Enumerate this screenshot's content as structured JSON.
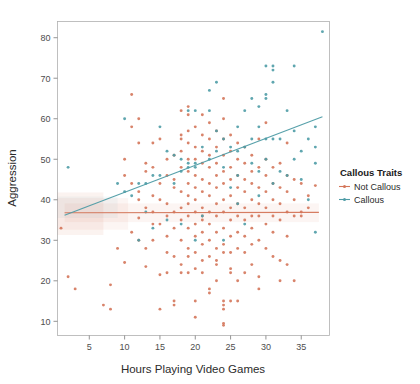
{
  "chart_data": {
    "type": "scatter",
    "title": "",
    "xlabel": "Hours Playing Video Games",
    "ylabel": "Aggression",
    "xlim": [
      0.5,
      39
    ],
    "ylim": [
      6.5,
      84
    ],
    "xticks": [
      5,
      10,
      15,
      20,
      25,
      30,
      35
    ],
    "yticks": [
      10,
      20,
      30,
      40,
      50,
      60,
      70,
      80
    ],
    "grid": false,
    "legend": {
      "title": "Callous Traits",
      "position": "right",
      "entries": [
        {
          "name": "Not Callous",
          "color": "#D4765A"
        },
        {
          "name": "Callous",
          "color": "#4E9CA6"
        }
      ]
    },
    "series": [
      {
        "name": "Not Callous",
        "color": "#D4765A",
        "fit": {
          "type": "linear",
          "x": [
            1.5,
            37.5
          ],
          "y": [
            36.8,
            36.9
          ],
          "band": true
        },
        "points": [
          [
            1,
            33
          ],
          [
            2,
            21
          ],
          [
            3,
            18
          ],
          [
            7,
            14
          ],
          [
            8,
            13
          ],
          [
            8,
            19
          ],
          [
            9,
            28
          ],
          [
            10,
            46
          ],
          [
            10,
            24.5
          ],
          [
            11,
            66
          ],
          [
            11,
            58
          ],
          [
            11,
            32
          ],
          [
            11,
            44
          ],
          [
            12,
            54
          ],
          [
            12,
            60
          ],
          [
            12,
            42
          ],
          [
            12,
            35.5
          ],
          [
            12,
            30
          ],
          [
            13,
            49
          ],
          [
            13,
            47
          ],
          [
            13,
            38
          ],
          [
            13,
            28
          ],
          [
            13,
            23.5
          ],
          [
            14,
            54
          ],
          [
            14,
            48
          ],
          [
            14,
            41
          ],
          [
            14,
            37
          ],
          [
            14,
            34
          ],
          [
            15,
            55
          ],
          [
            15,
            44
          ],
          [
            15,
            40
          ],
          [
            15,
            34
          ],
          [
            15,
            21.5
          ],
          [
            15,
            13
          ],
          [
            16,
            50
          ],
          [
            16,
            46
          ],
          [
            16,
            39
          ],
          [
            16,
            36
          ],
          [
            16,
            31
          ],
          [
            16,
            22
          ],
          [
            17,
            51
          ],
          [
            17,
            45
          ],
          [
            17,
            43
          ],
          [
            17,
            37
          ],
          [
            17,
            33
          ],
          [
            17,
            26
          ],
          [
            17,
            15
          ],
          [
            17,
            14
          ],
          [
            18,
            62
          ],
          [
            18,
            56
          ],
          [
            18,
            55
          ],
          [
            18,
            52
          ],
          [
            18,
            48
          ],
          [
            18,
            42
          ],
          [
            18,
            38
          ],
          [
            18,
            35
          ],
          [
            18,
            30
          ],
          [
            18,
            24
          ],
          [
            18,
            22
          ],
          [
            19,
            61
          ],
          [
            19,
            57
          ],
          [
            19,
            54
          ],
          [
            19,
            50
          ],
          [
            19,
            47
          ],
          [
            19,
            44
          ],
          [
            19,
            41
          ],
          [
            19,
            39
          ],
          [
            19,
            36
          ],
          [
            19,
            33
          ],
          [
            19,
            28
          ],
          [
            19,
            26
          ],
          [
            19,
            22
          ],
          [
            20,
            58
          ],
          [
            20,
            53
          ],
          [
            20,
            50
          ],
          [
            20,
            46
          ],
          [
            20,
            43
          ],
          [
            20,
            40
          ],
          [
            20,
            37
          ],
          [
            20,
            34
          ],
          [
            20,
            31
          ],
          [
            20,
            27
          ],
          [
            20,
            23
          ],
          [
            20,
            15
          ],
          [
            20,
            11
          ],
          [
            21,
            61
          ],
          [
            21,
            56
          ],
          [
            21,
            52
          ],
          [
            21,
            49
          ],
          [
            21,
            45
          ],
          [
            21,
            42
          ],
          [
            21,
            38
          ],
          [
            21,
            35
          ],
          [
            21,
            32
          ],
          [
            21,
            29
          ],
          [
            21,
            25
          ],
          [
            21,
            22
          ],
          [
            22,
            59
          ],
          [
            22,
            55
          ],
          [
            22,
            51
          ],
          [
            22,
            48
          ],
          [
            22,
            44
          ],
          [
            22,
            41
          ],
          [
            22,
            37
          ],
          [
            22,
            34
          ],
          [
            22,
            30
          ],
          [
            22,
            26
          ],
          [
            22,
            18
          ],
          [
            22,
            17
          ],
          [
            23,
            57
          ],
          [
            23,
            53
          ],
          [
            23,
            49
          ],
          [
            23,
            46
          ],
          [
            23,
            43
          ],
          [
            23,
            39
          ],
          [
            23,
            36
          ],
          [
            23,
            32
          ],
          [
            23,
            28
          ],
          [
            23,
            24
          ],
          [
            23,
            20
          ],
          [
            24,
            65
          ],
          [
            24,
            60
          ],
          [
            24,
            55
          ],
          [
            24,
            51
          ],
          [
            24,
            47
          ],
          [
            24,
            44
          ],
          [
            24,
            40
          ],
          [
            24,
            37
          ],
          [
            24,
            33
          ],
          [
            24,
            29
          ],
          [
            24,
            27
          ],
          [
            24,
            15
          ],
          [
            24,
            14
          ],
          [
            24,
            13
          ],
          [
            24,
            9.5
          ],
          [
            24,
            9
          ],
          [
            25,
            56
          ],
          [
            25,
            52
          ],
          [
            25,
            48
          ],
          [
            25,
            45
          ],
          [
            25,
            41
          ],
          [
            25,
            38
          ],
          [
            25,
            35
          ],
          [
            25,
            31
          ],
          [
            25,
            27
          ],
          [
            25,
            23
          ],
          [
            25,
            15
          ],
          [
            26,
            54
          ],
          [
            26,
            50
          ],
          [
            26,
            46
          ],
          [
            26,
            43
          ],
          [
            26,
            39
          ],
          [
            26,
            36
          ],
          [
            26,
            32
          ],
          [
            26,
            28
          ],
          [
            26,
            20
          ],
          [
            26,
            15
          ],
          [
            27,
            53
          ],
          [
            27,
            49
          ],
          [
            27,
            45
          ],
          [
            27,
            42
          ],
          [
            27,
            38
          ],
          [
            27,
            35
          ],
          [
            27,
            31
          ],
          [
            27,
            27
          ],
          [
            27,
            22
          ],
          [
            28,
            51
          ],
          [
            28,
            47
          ],
          [
            28,
            44
          ],
          [
            28,
            40
          ],
          [
            28,
            36
          ],
          [
            28,
            33
          ],
          [
            28,
            29
          ],
          [
            28,
            24
          ],
          [
            29,
            55
          ],
          [
            29,
            48
          ],
          [
            29,
            43
          ],
          [
            29,
            39
          ],
          [
            29,
            36
          ],
          [
            29,
            30
          ],
          [
            29,
            21
          ],
          [
            29,
            18
          ],
          [
            30,
            59
          ],
          [
            30,
            50
          ],
          [
            30,
            46
          ],
          [
            30,
            42
          ],
          [
            30,
            38
          ],
          [
            30,
            34
          ],
          [
            30,
            28
          ],
          [
            31,
            48
          ],
          [
            31,
            44
          ],
          [
            31,
            40
          ],
          [
            31,
            36
          ],
          [
            31,
            32
          ],
          [
            31,
            26
          ],
          [
            32,
            49
          ],
          [
            32,
            43
          ],
          [
            32,
            39
          ],
          [
            32,
            35
          ],
          [
            32,
            25
          ],
          [
            32,
            20
          ],
          [
            33,
            54
          ],
          [
            33,
            46
          ],
          [
            33,
            42
          ],
          [
            33,
            37
          ],
          [
            33,
            31
          ],
          [
            33,
            24
          ],
          [
            34,
            45
          ],
          [
            34,
            40
          ],
          [
            34,
            36
          ],
          [
            34,
            20
          ],
          [
            35,
            44
          ],
          [
            35,
            37
          ],
          [
            35,
            36
          ],
          [
            36,
            38
          ],
          [
            36,
            41
          ],
          [
            37,
            43.5
          ],
          [
            10,
            50
          ],
          [
            12,
            40
          ],
          [
            14,
            30
          ],
          [
            16,
            27
          ],
          [
            19,
            63
          ],
          [
            21,
            36
          ],
          [
            23,
            25
          ],
          [
            25,
            22
          ]
        ]
      },
      {
        "name": "Callous",
        "color": "#4E9CA6",
        "fit": {
          "type": "linear",
          "x": [
            1.5,
            38
          ],
          "y": [
            36.2,
            60.5
          ],
          "band": false
        },
        "points": [
          [
            2,
            48
          ],
          [
            9,
            44
          ],
          [
            10,
            60
          ],
          [
            10,
            42
          ],
          [
            11,
            41
          ],
          [
            12,
            44
          ],
          [
            13,
            44
          ],
          [
            13,
            37
          ],
          [
            14,
            46
          ],
          [
            14,
            33
          ],
          [
            15,
            58
          ],
          [
            15,
            46
          ],
          [
            16,
            52
          ],
          [
            16,
            35
          ],
          [
            17,
            51
          ],
          [
            17,
            44
          ],
          [
            18,
            50
          ],
          [
            18,
            47
          ],
          [
            19,
            62
          ],
          [
            19,
            49
          ],
          [
            19,
            48
          ],
          [
            20,
            62
          ],
          [
            20,
            49
          ],
          [
            20,
            48
          ],
          [
            21,
            53
          ],
          [
            21,
            36
          ],
          [
            22,
            67
          ],
          [
            22,
            62
          ],
          [
            22,
            50
          ],
          [
            23,
            69
          ],
          [
            23,
            57
          ],
          [
            23,
            52
          ],
          [
            24,
            55
          ],
          [
            24,
            48
          ],
          [
            25,
            53
          ],
          [
            25,
            43
          ],
          [
            26,
            58
          ],
          [
            26,
            52
          ],
          [
            26,
            46
          ],
          [
            27,
            62
          ],
          [
            27,
            53
          ],
          [
            27,
            34
          ],
          [
            28,
            65
          ],
          [
            28,
            55
          ],
          [
            28,
            49
          ],
          [
            29,
            58
          ],
          [
            29,
            63
          ],
          [
            29,
            47
          ],
          [
            30,
            73
          ],
          [
            30,
            66
          ],
          [
            30,
            65
          ],
          [
            30,
            55
          ],
          [
            30,
            50
          ],
          [
            31,
            69
          ],
          [
            31,
            73
          ],
          [
            31,
            72
          ],
          [
            31,
            55
          ],
          [
            31,
            44
          ],
          [
            32,
            55
          ],
          [
            32,
            47
          ],
          [
            33,
            62
          ],
          [
            33,
            46
          ],
          [
            34,
            73
          ],
          [
            34,
            57
          ],
          [
            34,
            50
          ],
          [
            35,
            52
          ],
          [
            35,
            45
          ],
          [
            36,
            55
          ],
          [
            36,
            40
          ],
          [
            37,
            58
          ],
          [
            37,
            53
          ],
          [
            37,
            49
          ],
          [
            37,
            32
          ],
          [
            38,
            81.5
          ],
          [
            12,
            30
          ],
          [
            18,
            34
          ],
          [
            20,
            30
          ],
          [
            24,
            30
          ],
          [
            26,
            39
          ],
          [
            29,
            41
          ]
        ]
      }
    ]
  }
}
